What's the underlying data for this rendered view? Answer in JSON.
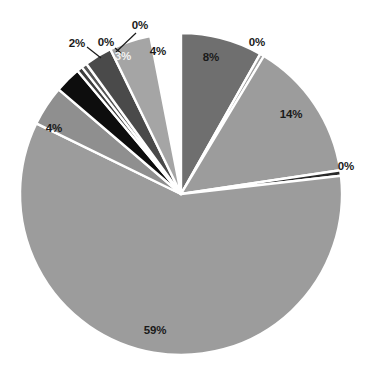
{
  "chart_data": {
    "type": "pie",
    "title": "",
    "subtitle": "",
    "xlabel": "",
    "ylabel": "",
    "legend": "none",
    "grid": false,
    "start_angle_deg": 0,
    "direction": "clockwise",
    "center": [
      181,
      194
    ],
    "radius": 161,
    "separator_color": "#ffffff",
    "background": "#ffffff",
    "categories": [
      "Slice 1",
      "Slice 2",
      "Slice 3",
      "Slice 4",
      "Slice 5",
      "Slice 6",
      "Slice 7",
      "Slice 8",
      "Slice 9",
      "Slice 10",
      "Slice 11"
    ],
    "values": [
      8,
      0.4,
      14,
      0.5,
      59,
      4,
      2,
      0.4,
      0.4,
      3,
      4
    ],
    "labels": [
      "8%",
      "0%",
      "14%",
      "0%",
      "59%",
      "4%",
      "2%",
      "0%",
      "0%",
      "3%",
      "4%"
    ],
    "colors": [
      "#6f6f6f",
      "#9c9c9c",
      "#9c9c9c",
      "#2a2a2a",
      "#9c9c9c",
      "#8f8f8f",
      "#0d0d0d",
      "#3d3d3d",
      "#555555",
      "#4a4a4a",
      "#a5a5a5"
    ],
    "slices": [
      {
        "label": "8%",
        "value": 8,
        "color": "#6f6f6f",
        "start_deg": 0,
        "end_deg": 29.5,
        "label_x": 211,
        "label_y": 58,
        "label_on_dark": false,
        "leader": false
      },
      {
        "label": "0%",
        "value": 0.4,
        "color": "#9c9c9c",
        "start_deg": 29.5,
        "end_deg": 31.0,
        "label_x": 257,
        "label_y": 43,
        "label_on_dark": false,
        "leader": false
      },
      {
        "label": "14%",
        "value": 14,
        "color": "#9c9c9c",
        "start_deg": 31.0,
        "end_deg": 81.5,
        "label_x": 291,
        "label_y": 115,
        "label_on_dark": false,
        "leader": false
      },
      {
        "label": "0%",
        "value": 0.5,
        "color": "#2a2a2a",
        "start_deg": 81.5,
        "end_deg": 83.5,
        "label_x": 346,
        "label_y": 167,
        "label_on_dark": false,
        "leader": false
      },
      {
        "label": "59%",
        "value": 59,
        "color": "#9c9c9c",
        "start_deg": 83.5,
        "end_deg": 296.0,
        "label_x": 155,
        "label_y": 331,
        "label_on_dark": false,
        "leader": false
      },
      {
        "label": "4%",
        "value": 4,
        "color": "#8f8f8f",
        "start_deg": 296.0,
        "end_deg": 310.5,
        "label_x": 54,
        "label_y": 129,
        "label_on_dark": false,
        "leader": false
      },
      {
        "label": "2%",
        "value": 2,
        "color": "#0d0d0d",
        "start_deg": 310.5,
        "end_deg": 320.0,
        "label_x": 77,
        "label_y": 44,
        "label_on_dark": false,
        "leader": true
      },
      {
        "label": "0%",
        "value": 0.4,
        "color": "#3d3d3d",
        "start_deg": 320.0,
        "end_deg": 322.0,
        "label_x": 106,
        "label_y": 43,
        "label_on_dark": false,
        "leader": true
      },
      {
        "label": "0%",
        "value": 0.4,
        "color": "#555555",
        "start_deg": 322.0,
        "end_deg": 324.0,
        "label_x": 140,
        "label_y": 26,
        "label_on_dark": false,
        "leader": true
      },
      {
        "label": "3%",
        "value": 3,
        "color": "#4a4a4a",
        "start_deg": 324.0,
        "end_deg": 334.0,
        "label_x": 123,
        "label_y": 57,
        "label_on_dark": true,
        "leader": false
      },
      {
        "label": "4%",
        "value": 4,
        "color": "#a5a5a5",
        "start_deg": 334.0,
        "end_deg": 349.0,
        "label_x": 158,
        "label_y": 52,
        "label_on_dark": false,
        "leader": false
      }
    ],
    "leader_lines": [
      {
        "name": "leader-2pct",
        "x1": 87,
        "y1": 47,
        "x2": 101,
        "y2": 58
      },
      {
        "name": "leader-0pct-a",
        "x1": 115,
        "y1": 48,
        "x2": 122,
        "y2": 54
      },
      {
        "name": "leader-0pct-b",
        "x1": 136,
        "y1": 33,
        "x2": 116,
        "y2": 52
      }
    ]
  }
}
